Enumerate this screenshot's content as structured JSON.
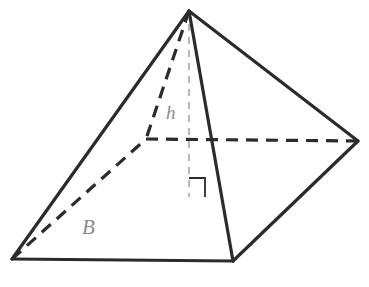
{
  "figure": {
    "name": "square-pyramid-with-height-and-base",
    "type": "geometric-solid-diagram",
    "background_color": "#ffffff",
    "solid_edge_color": "#2b2b2b",
    "hidden_edge_color": "#2b2b2b",
    "altitude_color": "#a6a6a6",
    "label_color": "#8a8a8a",
    "solid_stroke_width": 3.2,
    "hidden_stroke_width": 3.2,
    "altitude_stroke_width": 1.6,
    "right_angle_stroke_width": 1.8
  },
  "vertices": {
    "apex": {
      "name": "apex",
      "x": 189,
      "y": 11
    },
    "base_front_left": {
      "name": "base-front-left",
      "x": 12,
      "y": 259
    },
    "base_front_right": {
      "name": "base-front-right",
      "x": 233,
      "y": 261
    },
    "base_right": {
      "name": "base-right",
      "x": 358,
      "y": 141
    },
    "base_back_hidden": {
      "name": "base-back-hidden",
      "x": 146,
      "y": 139
    },
    "altitude_foot": {
      "name": "altitude-foot",
      "x": 189,
      "y": 197
    }
  },
  "edges": {
    "solid": [
      {
        "name": "lateral-edge-apex-to-front-left",
        "points": "189,11 12,259"
      },
      {
        "name": "lateral-edge-apex-to-front-right",
        "points": "189,11 233,261"
      },
      {
        "name": "lateral-edge-apex-to-right",
        "points": "189,11 358,141"
      },
      {
        "name": "base-edge-front-left-to-front-right",
        "points": "12,259 233,261"
      },
      {
        "name": "base-edge-front-right-to-right",
        "points": "233,261 358,141"
      }
    ],
    "dashed_hidden": [
      {
        "name": "hidden-lateral-edge-apex-to-back",
        "points": "189,11 146,139"
      },
      {
        "name": "hidden-base-edge-back-to-right",
        "points": "146,139 358,141"
      },
      {
        "name": "hidden-base-edge-front-left-to-back",
        "points": "12,259 146,139"
      }
    ],
    "altitude": {
      "name": "altitude-height-line",
      "points": "189,11 189,197",
      "dash_pattern": "7,6"
    },
    "hidden_dash_pattern": "12,8"
  },
  "right_angle_marker": {
    "name": "right-angle-marker",
    "points": "189,178 205,178 205,197"
  },
  "labels": {
    "height": {
      "name": "height-label",
      "text": "h",
      "meaning": "height of the pyramid",
      "x": 174,
      "y": 115
    },
    "base": {
      "name": "base-area-label",
      "text": "B",
      "meaning": "area of the base",
      "x": 90,
      "y": 228
    }
  }
}
